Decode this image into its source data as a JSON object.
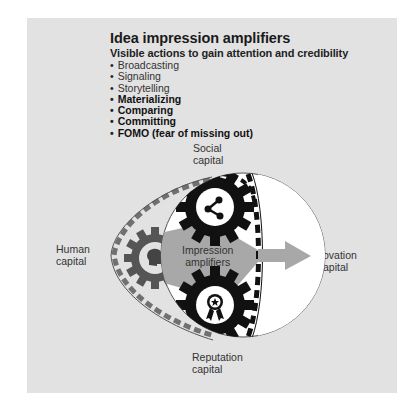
{
  "header": {
    "title": "Idea impression amplifiers",
    "subtitle": "Visible actions to gain attention and credibility"
  },
  "bullets": [
    {
      "label": "Broadcasting",
      "bold": false
    },
    {
      "label": "Signaling",
      "bold": false
    },
    {
      "label": "Storytelling",
      "bold": false
    },
    {
      "label": "Materializing",
      "bold": true
    },
    {
      "label": "Comparing",
      "bold": true
    },
    {
      "label": "Committing",
      "bold": true
    },
    {
      "label": "FOMO (fear of missing out)",
      "bold": true
    }
  ],
  "diagram": {
    "social": {
      "line1": "Social",
      "line2": "capital",
      "icon": "network-icon"
    },
    "human": {
      "line1": "Human",
      "line2": "capital",
      "icon": "head-icon"
    },
    "center": {
      "line1": "Impression",
      "line2": "amplifiers"
    },
    "innovation": {
      "line1": "ovation",
      "line2": "apital",
      "full": "Innovation capital"
    },
    "reputation": {
      "line1": "Reputation",
      "line2": "capital",
      "icon": "award-ribbon-icon"
    }
  },
  "colors": {
    "panel": "#e2e2e2",
    "gear_dark": "#111111",
    "gear_gray": "#555555",
    "arrow": "#a8a8a8",
    "belt": "#666666"
  }
}
